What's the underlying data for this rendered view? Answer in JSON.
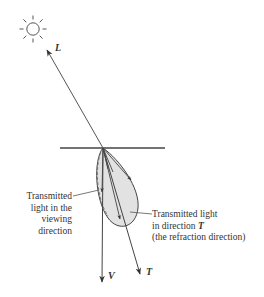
{
  "diagram": {
    "colors": {
      "line": "#444444",
      "lobe_fill": "#e2e2e2",
      "text": "#333333"
    },
    "vectors": {
      "L": "L",
      "V": "V",
      "T": "T"
    },
    "annotations": {
      "viewing": {
        "line1": "Transmitted",
        "line2": "light in the",
        "line3": "viewing",
        "line4": "direction"
      },
      "refraction": {
        "line1": "Transmitted light",
        "line2_prefix": "in direction ",
        "line2_vector": "T",
        "line3": "(the refraction direction)"
      }
    },
    "icons": {
      "light_source": "sun-icon"
    }
  }
}
